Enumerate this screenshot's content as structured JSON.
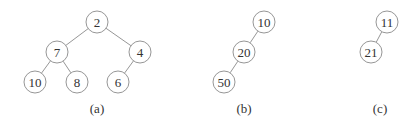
{
  "diagram": {
    "type": "binary-trees",
    "node_radius": 11,
    "colors": {
      "stroke": "#8a8a8a",
      "text": "#333333",
      "background": "#ffffff"
    },
    "trees": [
      {
        "caption": "(a)",
        "caption_pos": [
          97,
          108
        ],
        "nodes": [
          {
            "id": "a2",
            "label": "2",
            "x": 97,
            "y": 22
          },
          {
            "id": "a7",
            "label": "7",
            "x": 57,
            "y": 52
          },
          {
            "id": "a4",
            "label": "4",
            "x": 140,
            "y": 52
          },
          {
            "id": "a10",
            "label": "10",
            "x": 35,
            "y": 82
          },
          {
            "id": "a8",
            "label": "8",
            "x": 77,
            "y": 82
          },
          {
            "id": "a6",
            "label": "6",
            "x": 118,
            "y": 82
          }
        ],
        "edges": [
          [
            "a2",
            "a7"
          ],
          [
            "a2",
            "a4"
          ],
          [
            "a7",
            "a10"
          ],
          [
            "a7",
            "a8"
          ],
          [
            "a4",
            "a6"
          ]
        ]
      },
      {
        "caption": "(b)",
        "caption_pos": [
          244,
          108
        ],
        "nodes": [
          {
            "id": "b10",
            "label": "10",
            "x": 264,
            "y": 22
          },
          {
            "id": "b20",
            "label": "20",
            "x": 244,
            "y": 52
          },
          {
            "id": "b50",
            "label": "50",
            "x": 224,
            "y": 82
          }
        ],
        "edges": [
          [
            "b10",
            "b20"
          ],
          [
            "b20",
            "b50"
          ]
        ]
      },
      {
        "caption": "(c)",
        "caption_pos": [
          380,
          108
        ],
        "nodes": [
          {
            "id": "c11",
            "label": "11",
            "x": 387,
            "y": 22
          },
          {
            "id": "c21",
            "label": "21",
            "x": 371,
            "y": 52
          }
        ],
        "edges": [
          [
            "c11",
            "c21"
          ]
        ]
      }
    ]
  }
}
